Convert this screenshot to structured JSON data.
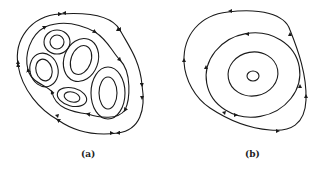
{
  "figure": {
    "panels": [
      {
        "id": "a",
        "label": "(a)",
        "description": "Outer closed streamline enclosing five separate vortex cells, each with nested closed orbits"
      },
      {
        "id": "b",
        "label": "(b)",
        "description": "Single center with nested closed orbits"
      }
    ],
    "colors": {
      "stroke": "#1a1a1a",
      "background": "#ffffff"
    }
  }
}
